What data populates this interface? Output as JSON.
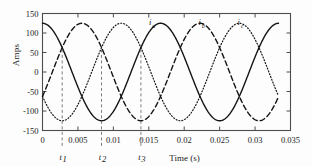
{
  "chart_data": {
    "type": "line",
    "title": "",
    "xlabel": "Time (s)",
    "ylabel": "Amps",
    "xlim": [
      0,
      0.035
    ],
    "ylim": [
      -150,
      150
    ],
    "xticks": [
      "0",
      "0.005",
      "0.01",
      "0.015",
      "0.02",
      "0.025",
      "0.03",
      "0.035"
    ],
    "xtick_values": [
      0,
      0.005,
      0.01,
      0.015,
      0.02,
      0.025,
      0.03,
      0.035
    ],
    "yticks": [
      "150",
      "100",
      "50",
      "0",
      "-50",
      "-100",
      "-150"
    ],
    "ytick_values": [
      150,
      100,
      50,
      0,
      -50,
      -100,
      -150
    ],
    "grid": false,
    "legend_position": "inline-on-curves",
    "amplitude": 125,
    "frequency_hz": 60,
    "x_data_end": 0.0333,
    "series": [
      {
        "name": "i_a",
        "label_letter": "i",
        "label_sub": "a",
        "style": "solid",
        "phase_deg": 0,
        "label_x": 0.0152,
        "label_y": 120
      },
      {
        "name": "i_b",
        "label_letter": "i",
        "label_sub": "b",
        "style": "dashed",
        "phase_deg": -120,
        "label_x": 0.0222,
        "label_y": 120
      },
      {
        "name": "i_c",
        "label_letter": "i",
        "label_sub": "c",
        "style": "dotted",
        "phase_deg": 120,
        "label_x": 0.0277,
        "label_y": 120
      }
    ],
    "annotations": [
      {
        "name": "t1",
        "letter": "t",
        "sub": "1",
        "x": 0.00278,
        "y_top": 58
      },
      {
        "name": "t2",
        "letter": "t",
        "sub": "2",
        "x": 0.00833,
        "y_top": 58
      },
      {
        "name": "t3",
        "letter": "t",
        "sub": "3",
        "x": 0.01389,
        "y_top": 58
      }
    ],
    "colors": {
      "curve": "#141414",
      "axis": "#4d4d4d",
      "annotation": "#6e6e6e",
      "text": "#1b1b1b",
      "background": "#fdfdfd"
    }
  }
}
